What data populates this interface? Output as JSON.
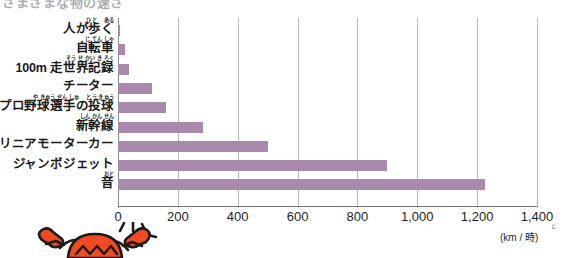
{
  "chart_title": "さまざまな物の速さ",
  "axis": {
    "unit": "(km / 時)",
    "unit_ruby": "じ",
    "ticks": [
      "0",
      "200",
      "400",
      "600",
      "800",
      "1,000",
      "1,200",
      "1,400"
    ],
    "tick_values": [
      0,
      200,
      400,
      600,
      800,
      1000,
      1200,
      1400
    ],
    "xmin": 0,
    "xmax": 1400
  },
  "colors": {
    "bar": "#a98aad",
    "gridline": "#b9b9bb",
    "axis": "#6f6f71",
    "title": "#8e9398",
    "mascot": "#f04a23",
    "mascot_outline": "#1a1a1a"
  },
  "mascot": {
    "name": "crab-character",
    "description": "オレンジ色のカニのキャラクター"
  },
  "categories": [
    {
      "main": "人が歩く",
      "ruby": "ひと　 ある"
    },
    {
      "main": "自転車",
      "ruby": "じ てん しゃ"
    },
    {
      "main": "100m 走世界記録",
      "ruby": "そう せ かい き ろく"
    },
    {
      "main": "チーター",
      "ruby": ""
    },
    {
      "main": "プロ野球選手の投球",
      "ruby": "や きゅう せん しゅ　 とう きゅう"
    },
    {
      "main": "新幹線",
      "ruby": "しん かん せん"
    },
    {
      "main": "リニアモーターカー",
      "ruby": ""
    },
    {
      "main": "ジャンボジェット",
      "ruby": ""
    },
    {
      "main": "音",
      "ruby": "おと"
    }
  ],
  "chart_data": {
    "type": "bar",
    "orientation": "horizontal",
    "title": "さまざまな物の速さ",
    "xlabel": "(km / 時)",
    "ylabel": "",
    "xlim": [
      0,
      1400
    ],
    "grid": true,
    "legend": "none",
    "categories": [
      "人が歩く",
      "自転車",
      "100m 走世界記録",
      "チーター",
      "プロ野球選手の投球",
      "新幹線",
      "リニアモーターカー",
      "ジャンボジェット",
      "音"
    ],
    "values": [
      5,
      25,
      37,
      115,
      160,
      285,
      500,
      900,
      1225
    ],
    "bar_color": "#a98aad"
  }
}
